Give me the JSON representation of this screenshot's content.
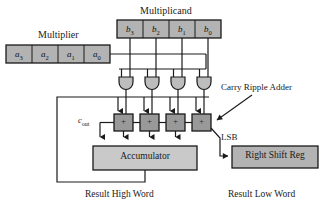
{
  "figure": {
    "title_multiplier": "Multiplier",
    "title_multiplicand": "Multiplicand",
    "annotation_adder": "Carry Ripple Adder",
    "label_lsb": "LSB",
    "label_cout_base": "c",
    "label_cout_sub": "out",
    "accumulator_label": "Accumulator",
    "shift_reg_label": "Right Shift Reg",
    "result_high": "Result High Word",
    "result_low": "Result Low Word",
    "plus_symbol": "+"
  },
  "multiplier_bits": [
    {
      "base": "a",
      "sub": "3"
    },
    {
      "base": "a",
      "sub": "2"
    },
    {
      "base": "a",
      "sub": "1"
    },
    {
      "base": "a",
      "sub": "0"
    }
  ],
  "multiplicand_bits": [
    {
      "base": "b",
      "sub": "3"
    },
    {
      "base": "b",
      "sub": "2"
    },
    {
      "base": "b",
      "sub": "1"
    },
    {
      "base": "b",
      "sub": "0"
    }
  ],
  "adder_cells": [
    {
      "label": "+"
    },
    {
      "label": "+"
    },
    {
      "label": "+"
    },
    {
      "label": "+"
    }
  ],
  "and_gates": [
    {
      "name": "and-gate-3"
    },
    {
      "name": "and-gate-2"
    },
    {
      "name": "and-gate-1"
    },
    {
      "name": "and-gate-0"
    }
  ],
  "colors": {
    "register_fill": "#b3b3b3",
    "adder_fill": "#999999",
    "gate_fill": "#bdbdbd",
    "accumulator_fill": "#c9c9c9",
    "stroke": "#1a1a1a",
    "background": "#ffffff"
  }
}
